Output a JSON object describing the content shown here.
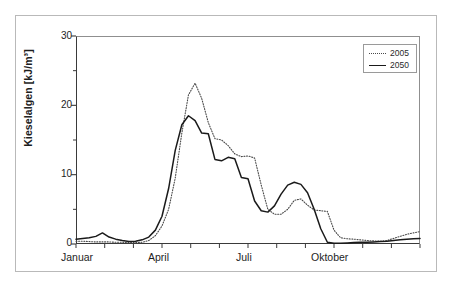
{
  "chart_data": {
    "type": "line",
    "title": "Kieselalgen",
    "xlabel": "",
    "ylabel": "Kieselalgen [kJ/m³]",
    "ylim": [
      0,
      30
    ],
    "xlim": [
      0,
      52
    ],
    "yticks": [
      0,
      10,
      20,
      30
    ],
    "yticks_minor": [
      5,
      15,
      25
    ],
    "xtick_labels": [
      "Januar",
      "April",
      "Juli",
      "Oktober"
    ],
    "xtick_label_positions": [
      0,
      13,
      26,
      39
    ],
    "xticks_minor": [
      0,
      4.34,
      8.68,
      13,
      17.34,
      21.68,
      26,
      30.34,
      34.68,
      39,
      43.34,
      47.68,
      52
    ],
    "grid": false,
    "legend_position": "top-right",
    "series": [
      {
        "name": "2005",
        "style": "dotted",
        "color": "#4a4a4a",
        "x": [
          0,
          1,
          2,
          3,
          4,
          5,
          6,
          7,
          8,
          9,
          10,
          11,
          12,
          13,
          14,
          15,
          16,
          17,
          18,
          19,
          20,
          21,
          22,
          23,
          24,
          25,
          26,
          27,
          28,
          29,
          30,
          31,
          32,
          33,
          34,
          35,
          36,
          37,
          38,
          39,
          40,
          41,
          42,
          43,
          44,
          45,
          46,
          47,
          48,
          49,
          50,
          51,
          52
        ],
        "values": [
          0.4,
          0.4,
          0.35,
          0.3,
          0.3,
          0.3,
          0.25,
          0.25,
          0.2,
          0.2,
          0.25,
          0.5,
          1.2,
          2.6,
          5.0,
          9.5,
          16.0,
          21.5,
          23.2,
          21.0,
          17.5,
          15.2,
          15.0,
          14.2,
          13.0,
          12.6,
          12.7,
          12.4,
          8.5,
          5.0,
          4.3,
          4.3,
          5.0,
          6.3,
          6.5,
          5.6,
          4.9,
          4.8,
          4.7,
          2.0,
          0.9,
          0.75,
          0.7,
          0.6,
          0.5,
          0.45,
          0.4,
          0.5,
          0.8,
          1.1,
          1.4,
          1.6,
          1.8
        ]
      },
      {
        "name": "2050",
        "style": "solid",
        "color": "#1a1a1a",
        "x": [
          0,
          1,
          2,
          3,
          4,
          5,
          6,
          7,
          8,
          9,
          10,
          11,
          12,
          13,
          14,
          15,
          16,
          17,
          18,
          19,
          20,
          21,
          22,
          23,
          24,
          25,
          26,
          27,
          28,
          29,
          30,
          31,
          32,
          33,
          34,
          35,
          36,
          37,
          38,
          39,
          40,
          41,
          42,
          43,
          44,
          45,
          46,
          47,
          48,
          49,
          50,
          51,
          52
        ],
        "values": [
          0.7,
          0.8,
          0.9,
          1.1,
          1.6,
          1.0,
          0.7,
          0.5,
          0.35,
          0.4,
          0.6,
          1.0,
          2.0,
          4.0,
          8.0,
          13.5,
          17.2,
          18.5,
          17.8,
          16.0,
          15.9,
          12.2,
          12.0,
          12.5,
          12.3,
          9.6,
          9.4,
          6.2,
          4.8,
          4.6,
          5.5,
          7.2,
          8.5,
          8.9,
          8.6,
          7.4,
          5.0,
          2.2,
          0.25,
          0.1,
          0.1,
          0.15,
          0.2,
          0.25,
          0.25,
          0.3,
          0.35,
          0.4,
          0.5,
          0.6,
          0.7,
          0.75,
          0.8
        ]
      }
    ],
    "annotations": [
      {
        "text": "2005 peak ≈ 23.2 kJ/m³ (April)"
      },
      {
        "text": "2050 peak ≈ 18.5 kJ/m³ (April)"
      }
    ]
  },
  "legend": {
    "entries": [
      {
        "label": "2005",
        "style": "dotted"
      },
      {
        "label": "2050",
        "style": "solid"
      }
    ]
  },
  "axes": {
    "y_label": "Kieselalgen [kJ/m³]",
    "y_tick_labels": [
      "0",
      "10",
      "20",
      "30"
    ],
    "x_tick_labels": [
      "Januar",
      "April",
      "Juli",
      "Oktober"
    ]
  }
}
